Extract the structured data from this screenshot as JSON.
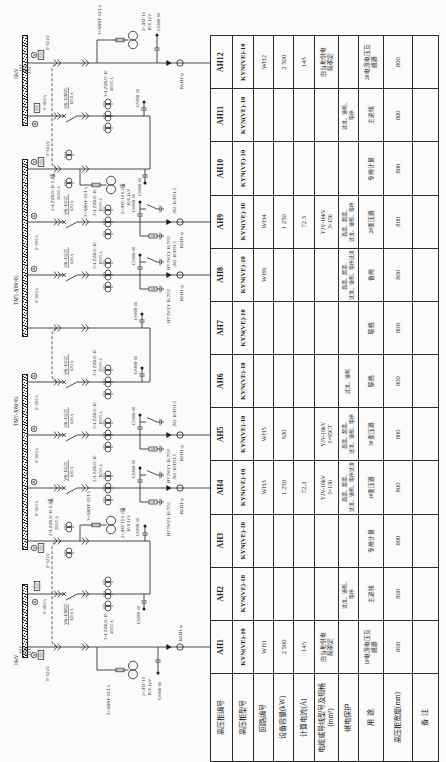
{
  "diagram": {
    "buses": {
      "incoming_1": "10kV",
      "section_1": "TMY-3(80×8)",
      "section_2": "TMY-3(80×8)",
      "incoming_2": "10kV"
    },
    "circuits": {
      "AH1": {
        "meter": "0~12kV",
        "fuse": "3×XRNP-12/1A",
        "pt": "2×JDZ-10",
        "pt_ratio": "10/0.1kV",
        "live_indicator": "GSNB-10",
        "zero_seq_ct": "KLH1-φ"
      },
      "AH2": {
        "meter": "0~400A",
        "breaker": "VK-10M25",
        "breaker_rating": "1250A",
        "ct": "3×LZZBJ9-10",
        "ct_ratio": "400/5A",
        "live_indicator": "GSNB-10"
      },
      "AH3": {
        "meter": "0~12kV",
        "ct": "2×LZZBJ9-10 0.2级",
        "ct_ratio": "200/5A",
        "fuse": "3×XRNP-12/1A",
        "pt": "2×JDZ-10 0.2级",
        "pt_ratio": "10/0.1kV",
        "live_indicator": "GSNB-10"
      },
      "AH4": {
        "meter": "0~100A",
        "breaker": "VK-10J25",
        "breaker_rating": "630A",
        "ct": "3×LZZBJ9-10",
        "ct_ratio": "100/5A",
        "live_indicator": "GSNB-10",
        "earthing_switch": "JN2-10/D31.5",
        "arrester": "HY5WZ1-16.7/50",
        "zero_seq_ct": "KLH1-φ"
      },
      "AH5": {
        "meter": "0~100A",
        "breaker": "VK-10J25",
        "breaker_rating": "630A",
        "ct": "3×LZZBJ9-10",
        "ct_ratio": "100/5A",
        "live_indicator": "GSNB-10",
        "earthing_switch": "JN2-10/D31.5",
        "arrester": "HY5WZ1-16.7/50",
        "zero_seq_ct": "KLH1-φ"
      },
      "AH6": {
        "meter": "0~200A",
        "breaker": "VK-10J25",
        "breaker_rating": "630A",
        "ct": "3×LZZBJ9-10",
        "ct_ratio": "200/5A",
        "live_indicator": "GSNB-10"
      },
      "AH7": {
        "live_indicator": "GSNB-10"
      },
      "AH8": {
        "meter": "0~100A",
        "breaker": "VK-10J25",
        "breaker_rating": "630A",
        "ct": "3×LZZBJ9-10",
        "ct_ratio": "100/5A",
        "live_indicator": "GSNB-10",
        "earthing_switch": "JN2-10/D31.5",
        "arrester": "HY5WZ1-16.7/50",
        "zero_seq_ct": "KLH1-φ"
      },
      "AH9": {
        "meter": "0~100A",
        "breaker": "VK-10J25",
        "breaker_rating": "630A",
        "ct": "3×LZZBJ9-10",
        "ct_ratio": "100/5A",
        "live_indicator": "GSNB-10",
        "earthing_switch": "JN2-10/D31.5",
        "arrester": "HY5WZ1-16.7/50",
        "zero_seq_ct": "KLH1-φ"
      },
      "AH10": {
        "meter": "0~12kV",
        "ct": "2×LZZBJ9-10 0.2级",
        "ct_ratio": "200/5A",
        "fuse": "3×XRNP-12/1A",
        "pt": "2×JDZ-10 0.2级",
        "pt_ratio": "10/0.1kV",
        "live_indicator": "GSNB-10"
      },
      "AH11": {
        "meter": "0~400A",
        "breaker": "VK-10M25",
        "breaker_rating": "1250A",
        "ct": "3×LZZBJ9-10",
        "ct_ratio": "400/5A",
        "live_indicator": "GSNB-10"
      },
      "AH12": {
        "meter": "0~12kV",
        "fuse": "3×XRNP-12/1A",
        "pt": "2×JDZ-10",
        "pt_ratio": "10/0.1kV",
        "live_indicator": "GSNB-10",
        "zero_seq_ct": "KLH1-φ"
      }
    }
  },
  "table": {
    "row_headers": [
      "高压柜编号",
      "高压柜型号",
      "回路编号",
      "设备容量(kW)",
      "计算电流(A)",
      "电缆或导线型号及规格\n(mm²)",
      "继电保护",
      "用  途",
      "高压柜宽度(mm)",
      "备  注"
    ],
    "columns": [
      {
        "id": "AH1",
        "model": "KYN(VE)-10",
        "circuit": "WH1",
        "capacity": "2 500",
        "current": "145",
        "cable": "由当地供电\n局确定",
        "protection": "",
        "usage": "1#电源电压互\n感器",
        "width": "800",
        "remark": ""
      },
      {
        "id": "AH2",
        "model": "KYN(VE)-10",
        "circuit": "",
        "capacity": "",
        "current": "",
        "cable": "",
        "protection": "过流、速断、\n零序",
        "usage": "主进线",
        "width": "800",
        "remark": ""
      },
      {
        "id": "AH3",
        "model": "KYN(VE)-10",
        "circuit": "",
        "capacity": "",
        "current": "",
        "cable": "",
        "protection": "",
        "usage": "专用计量",
        "width": "800",
        "remark": ""
      },
      {
        "id": "AH4",
        "model": "KYN(VE)-10",
        "circuit": "WH3",
        "capacity": "1 250",
        "current": "72.3",
        "cable": "YJV-10kV\n3×150",
        "protection": "高温、超温、\n过流、速断、零序过流",
        "usage": "1#变压器",
        "width": "800",
        "remark": ""
      },
      {
        "id": "AH5",
        "model": "KYN(VE)-10",
        "circuit": "WH5",
        "capacity": "630",
        "current": "",
        "cable": "YJV-10kV\n3×95CT",
        "protection": "高温、超温、\n过流、速断、零序",
        "usage": "3#变压器",
        "width": "800",
        "remark": ""
      },
      {
        "id": "AH6",
        "model": "KYN(VE)-10",
        "circuit": "",
        "capacity": "",
        "current": "",
        "cable": "",
        "protection": "过流、速断",
        "usage": "联络",
        "width": "800",
        "remark": ""
      },
      {
        "id": "AH7",
        "model": "KYN(VE)-10",
        "circuit": "",
        "capacity": "",
        "current": "",
        "cable": "",
        "protection": "",
        "usage": "联络",
        "width": "800",
        "remark": ""
      },
      {
        "id": "AH8",
        "model": "KYN(VE)-10",
        "circuit": "WH6",
        "capacity": "",
        "current": "",
        "cable": "",
        "protection": "高温、超温、\n过流、速断、零序过流",
        "usage": "备用",
        "width": "800",
        "remark": ""
      },
      {
        "id": "AH9",
        "model": "KYN(VE)-10",
        "circuit": "WH4",
        "capacity": "1 250",
        "current": "72.3",
        "cable": "YJV-10kV\n3×150",
        "protection": "高温、超温、\n过流、速断、零序",
        "usage": "2#变压器",
        "width": "800",
        "remark": ""
      },
      {
        "id": "AH10",
        "model": "KYN(VE)-10",
        "circuit": "",
        "capacity": "",
        "current": "",
        "cable": "",
        "protection": "",
        "usage": "专用计量",
        "width": "800",
        "remark": ""
      },
      {
        "id": "AH11",
        "model": "KYN(VE)-10",
        "circuit": "",
        "capacity": "",
        "current": "",
        "cable": "",
        "protection": "过流、速断、\n零序",
        "usage": "主进线",
        "width": "800",
        "remark": ""
      },
      {
        "id": "AH12",
        "model": "KYN(VE)-10",
        "circuit": "WH2",
        "capacity": "2 500",
        "current": "145",
        "cable": "由当地供电\n局确定",
        "protection": "",
        "usage": "2#电源电压互\n感器",
        "width": "800",
        "remark": ""
      }
    ]
  }
}
